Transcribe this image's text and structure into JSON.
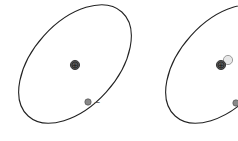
{
  "diagram": {
    "type": "atomic-model",
    "atoms": [
      {
        "id": "left",
        "orbit": {
          "cx": 75,
          "cy": 64,
          "rx": 70,
          "ry": 42,
          "rotate": -48
        },
        "nucleus": {
          "cx": 75,
          "cy": 65,
          "symbol": "+"
        },
        "extra_particle": null,
        "electron": {
          "cx": 88,
          "cy": 102,
          "symbol": "−"
        }
      },
      {
        "id": "right",
        "orbit": {
          "cx": 222,
          "cy": 64,
          "rx": 70,
          "ry": 42,
          "rotate": -48
        },
        "nucleus": {
          "cx": 221,
          "cy": 65,
          "symbol": "+"
        },
        "extra_particle": {
          "cx": 228,
          "cy": 60
        },
        "electron": {
          "cx": 236,
          "cy": 103,
          "symbol": ""
        }
      }
    ],
    "colors": {
      "orbit": "#222222",
      "nucleus_fill": "#555555",
      "neutron_fill": "#e8e8e8",
      "electron_fill": "#888888"
    }
  }
}
